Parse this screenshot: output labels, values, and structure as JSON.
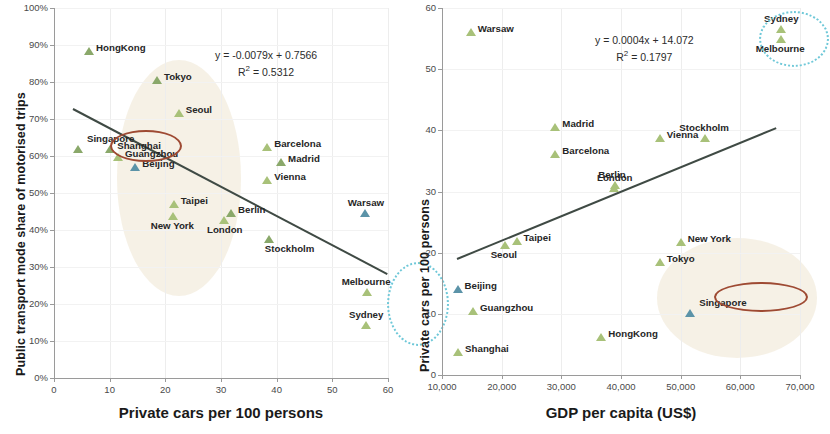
{
  "figure": {
    "width": 818,
    "height": 434,
    "background": "#ffffff"
  },
  "colors": {
    "marker_green": "#8aa86a",
    "marker_light_green": "#a8c179",
    "marker_blue": "#5b93a8",
    "trendline": "#3f4a44",
    "highlight_blob": "#f5efe2",
    "red_ellipse": "#9e4a33",
    "dotted_ellipse": "#6fc8d8",
    "axis": "#9a9a9a",
    "gridline": "#ededed"
  },
  "chart_data": [
    {
      "id": "left",
      "type": "scatter",
      "title": "",
      "xlabel": "Private cars per 100 persons",
      "ylabel": "Public transport mode share of motorised trips",
      "xlim": [
        0,
        60
      ],
      "ylim": [
        0,
        1.0
      ],
      "xticks": [
        "0",
        "10",
        "20",
        "30",
        "40",
        "50",
        "60"
      ],
      "xtick_values": [
        0,
        10,
        20,
        30,
        40,
        50,
        60
      ],
      "yticks": [
        "0%",
        "10%",
        "20%",
        "30%",
        "40%",
        "50%",
        "60%",
        "70%",
        "80%",
        "90%",
        "100%"
      ],
      "ytick_values": [
        0,
        0.1,
        0.2,
        0.3,
        0.4,
        0.5,
        0.6,
        0.7,
        0.8,
        0.9,
        1.0
      ],
      "grid": "light",
      "legend": "none",
      "annotations": {
        "equation": "y = -0.0079x + 0.7566",
        "r_squared": "R² = 0.5312"
      },
      "trendline": {
        "slope": -0.0079,
        "intercept": 0.7566,
        "x_start": 3.5,
        "x_end": 60.0
      },
      "points": [
        {
          "label": "HongKong",
          "x": 6.3,
          "y": 0.885,
          "color": "green",
          "label_pos": "right"
        },
        {
          "label": "Tokyo",
          "x": 18.5,
          "y": 0.805,
          "color": "green",
          "label_pos": "right"
        },
        {
          "label": "Seoul",
          "x": 22.4,
          "y": 0.715,
          "color": "lightgreen",
          "label_pos": "right"
        },
        {
          "label": "Singapore",
          "x": 4.3,
          "y": 0.62,
          "color": "green",
          "label_pos": "circled"
        },
        {
          "label": "Shanghai",
          "x": 10.1,
          "y": 0.62,
          "color": "green",
          "label_pos": "right"
        },
        {
          "label": "Guangzhou",
          "x": 11.5,
          "y": 0.598,
          "color": "lightgreen",
          "label_pos": "right"
        },
        {
          "label": "Beijing",
          "x": 14.6,
          "y": 0.57,
          "color": "blue",
          "label_pos": "right"
        },
        {
          "label": "Barcelona",
          "x": 38.3,
          "y": 0.625,
          "color": "lightgreen",
          "label_pos": "right"
        },
        {
          "label": "Madrid",
          "x": 40.8,
          "y": 0.583,
          "color": "green",
          "label_pos": "right"
        },
        {
          "label": "Vienna",
          "x": 38.3,
          "y": 0.535,
          "color": "lightgreen",
          "label_pos": "right"
        },
        {
          "label": "Taipei",
          "x": 21.5,
          "y": 0.47,
          "color": "lightgreen",
          "label_pos": "right"
        },
        {
          "label": "New York",
          "x": 21.4,
          "y": 0.437,
          "color": "lightgreen",
          "label_pos": "below"
        },
        {
          "label": "Berlin",
          "x": 31.8,
          "y": 0.447,
          "color": "green",
          "label_pos": "right"
        },
        {
          "label": "London",
          "x": 30.5,
          "y": 0.428,
          "color": "lightgreen",
          "label_pos": "below"
        },
        {
          "label": "Warsaw",
          "x": 55.8,
          "y": 0.447,
          "color": "blue",
          "label_pos": "above"
        },
        {
          "label": "Stockholm",
          "x": 38.6,
          "y": 0.377,
          "color": "green",
          "label_pos": "belowright"
        },
        {
          "label": "Melbourne",
          "x": 56.2,
          "y": 0.232,
          "color": "lightgreen",
          "label_pos": "above"
        },
        {
          "label": "Sydney",
          "x": 56.0,
          "y": 0.143,
          "color": "lightgreen",
          "label_pos": "above"
        }
      ],
      "highlight_regions": [
        {
          "type": "blob",
          "shape": "ellipse",
          "label": "asian-cities-cluster"
        },
        {
          "type": "red_ellipse",
          "shape": "ellipse",
          "label": "Singapore highlight"
        },
        {
          "type": "dotted_ellipse",
          "shape": "ellipse",
          "label": "Australian cities highlight"
        }
      ]
    },
    {
      "id": "right",
      "type": "scatter",
      "title": "",
      "xlabel": "GDP per capita (US$)",
      "ylabel": "Private cars per 100 persons",
      "xlim": [
        10000,
        70000
      ],
      "ylim": [
        0,
        60
      ],
      "xticks": [
        "10,000",
        "20,000",
        "30,000",
        "40,000",
        "50,000",
        "60,000",
        "70,000"
      ],
      "xtick_values": [
        10000,
        20000,
        30000,
        40000,
        50000,
        60000,
        70000
      ],
      "yticks": [
        "0",
        "10",
        "20",
        "30",
        "40",
        "50",
        "60"
      ],
      "ytick_values": [
        0,
        10,
        20,
        30,
        40,
        50,
        60
      ],
      "grid": "light",
      "legend": "none",
      "annotations": {
        "equation": "y = 0.0004x + 14.072",
        "r_squared": "R² = 0.1797"
      },
      "trendline": {
        "slope": 0.0004,
        "intercept": 14.072,
        "x_start": 12500,
        "x_end": 66000
      },
      "points": [
        {
          "label": "Warsaw",
          "x": 14800,
          "y": 56.0,
          "color": "lightgreen",
          "label_pos": "right"
        },
        {
          "label": "Sydney",
          "x": 66800,
          "y": 56.6,
          "color": "lightgreen",
          "label_pos": "above"
        },
        {
          "label": "Melbourne",
          "x": 66800,
          "y": 55.0,
          "color": "lightgreen",
          "label_pos": "below"
        },
        {
          "label": "Madrid",
          "x": 29000,
          "y": 40.6,
          "color": "lightgreen",
          "label_pos": "right"
        },
        {
          "label": "Vienna",
          "x": 46500,
          "y": 38.7,
          "color": "lightgreen",
          "label_pos": "right"
        },
        {
          "label": "Stockholm",
          "x": 54000,
          "y": 38.8,
          "color": "lightgreen",
          "label_pos": "above"
        },
        {
          "label": "Barcelona",
          "x": 29000,
          "y": 36.2,
          "color": "lightgreen",
          "label_pos": "right"
        },
        {
          "label": "Berlin",
          "x": 39000,
          "y": 31.0,
          "color": "lightgreen",
          "label_pos": "above"
        },
        {
          "label": "London",
          "x": 38800,
          "y": 30.5,
          "color": "lightgreen",
          "label_pos": "above"
        },
        {
          "label": "New York",
          "x": 50000,
          "y": 21.7,
          "color": "lightgreen",
          "label_pos": "right"
        },
        {
          "label": "Taipei",
          "x": 22500,
          "y": 21.9,
          "color": "lightgreen",
          "label_pos": "right"
        },
        {
          "label": "Seoul",
          "x": 20500,
          "y": 21.3,
          "color": "lightgreen",
          "label_pos": "below"
        },
        {
          "label": "Tokyo",
          "x": 46500,
          "y": 18.4,
          "color": "lightgreen",
          "label_pos": "right"
        },
        {
          "label": "Beijing",
          "x": 12600,
          "y": 14.1,
          "color": "blue",
          "label_pos": "right"
        },
        {
          "label": "Guangzhou",
          "x": 15200,
          "y": 10.5,
          "color": "lightgreen",
          "label_pos": "right"
        },
        {
          "label": "Singapore",
          "x": 51600,
          "y": 10.2,
          "color": "blue",
          "label_pos": "circled"
        },
        {
          "label": "HongKong",
          "x": 36700,
          "y": 6.2,
          "color": "lightgreen",
          "label_pos": "right"
        },
        {
          "label": "Shanghai",
          "x": 12700,
          "y": 3.8,
          "color": "lightgreen",
          "label_pos": "right"
        }
      ],
      "highlight_regions": [
        {
          "type": "blob",
          "shape": "ellipse",
          "label": "high-gdp-low-car cluster"
        },
        {
          "type": "red_ellipse",
          "shape": "ellipse",
          "label": "Singapore highlight"
        },
        {
          "type": "dotted_ellipse",
          "shape": "ellipse",
          "label": "Australian cities highlight"
        }
      ]
    }
  ]
}
